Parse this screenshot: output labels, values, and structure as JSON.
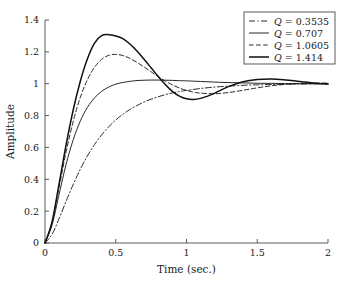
{
  "chart_data": {
    "type": "line",
    "title": "",
    "xlabel": "Time (sec.)",
    "ylabel": "Amplitude",
    "xlim": [
      0,
      2
    ],
    "ylim": [
      0,
      1.4
    ],
    "xticks": [
      "0",
      "0.5",
      "1",
      "1.5",
      "2"
    ],
    "xtick_values": [
      0,
      0.5,
      1,
      1.5,
      2
    ],
    "yticks": [
      "0",
      "0.2",
      "0.4",
      "0.6",
      "0.8",
      "1",
      "1.2",
      "1.4"
    ],
    "ytick_values": [
      0,
      0.2,
      0.4,
      0.6,
      0.8,
      1.0,
      1.2,
      1.4
    ],
    "grid": false,
    "legend_position": "upper right",
    "series": [
      {
        "name": "Q = 0.3535",
        "q": 0.3535,
        "linestyle": "dashdot",
        "linewidth": 0.9,
        "color": "#111111",
        "x": [
          0,
          0.05,
          0.1,
          0.15,
          0.2,
          0.25,
          0.3,
          0.35,
          0.4,
          0.45,
          0.5,
          0.55,
          0.6,
          0.65,
          0.7,
          0.75,
          0.8,
          0.85,
          0.9,
          0.95,
          1.0,
          1.1,
          1.2,
          1.3,
          1.4,
          1.5,
          1.6,
          1.7,
          1.8,
          1.9,
          2.0
        ],
        "y": [
          0,
          0.055,
          0.154,
          0.264,
          0.369,
          0.464,
          0.547,
          0.618,
          0.678,
          0.729,
          0.772,
          0.808,
          0.838,
          0.863,
          0.885,
          0.903,
          0.918,
          0.931,
          0.942,
          0.951,
          0.958,
          0.97,
          0.979,
          0.985,
          0.99,
          0.993,
          0.995,
          0.997,
          0.998,
          0.999,
          0.999
        ]
      },
      {
        "name": "Q = 0.707",
        "q": 0.707,
        "linestyle": "solid",
        "linewidth": 0.9,
        "color": "#111111",
        "x": [
          0,
          0.05,
          0.1,
          0.15,
          0.2,
          0.25,
          0.3,
          0.35,
          0.4,
          0.45,
          0.5,
          0.55,
          0.6,
          0.65,
          0.7,
          0.75,
          0.8,
          0.85,
          0.9,
          0.95,
          1.0,
          1.1,
          1.2,
          1.3,
          1.4,
          1.5,
          1.6,
          1.7,
          1.8,
          1.9,
          2.0
        ],
        "y": [
          0,
          0.113,
          0.308,
          0.497,
          0.65,
          0.767,
          0.852,
          0.911,
          0.952,
          0.979,
          0.997,
          1.008,
          1.015,
          1.02,
          1.022,
          1.023,
          1.023,
          1.022,
          1.021,
          1.019,
          1.018,
          1.014,
          1.01,
          1.007,
          1.005,
          1.003,
          1.002,
          1.001,
          1.0,
          1.0,
          1.0
        ]
      },
      {
        "name": "Q = 1.0605",
        "q": 1.0605,
        "linestyle": "dashed",
        "linewidth": 0.9,
        "color": "#111111",
        "x": [
          0,
          0.05,
          0.1,
          0.15,
          0.2,
          0.25,
          0.3,
          0.35,
          0.4,
          0.45,
          0.5,
          0.55,
          0.6,
          0.65,
          0.7,
          0.75,
          0.8,
          0.85,
          0.9,
          0.95,
          1.0,
          1.05,
          1.1,
          1.2,
          1.3,
          1.4,
          1.5,
          1.6,
          1.7,
          1.8,
          1.9,
          2.0
        ],
        "y": [
          0,
          0.128,
          0.352,
          0.575,
          0.766,
          0.915,
          1.026,
          1.103,
          1.153,
          1.178,
          1.184,
          1.177,
          1.159,
          1.134,
          1.105,
          1.075,
          1.045,
          1.017,
          0.993,
          0.973,
          0.958,
          0.947,
          0.941,
          0.937,
          0.945,
          0.959,
          0.974,
          0.987,
          0.996,
          1.002,
          1.004,
          1.004
        ]
      },
      {
        "name": "Q = 1.414",
        "q": 1.414,
        "linestyle": "solid",
        "linewidth": 1.5,
        "color": "#111111",
        "x": [
          0,
          0.05,
          0.1,
          0.15,
          0.2,
          0.25,
          0.3,
          0.35,
          0.4,
          0.45,
          0.5,
          0.55,
          0.6,
          0.65,
          0.7,
          0.75,
          0.8,
          0.85,
          0.9,
          0.95,
          1.0,
          1.05,
          1.1,
          1.15,
          1.2,
          1.3,
          1.4,
          1.5,
          1.6,
          1.7,
          1.8,
          1.9,
          2.0
        ],
        "y": [
          0,
          0.134,
          0.374,
          0.62,
          0.838,
          1.017,
          1.157,
          1.255,
          1.302,
          1.308,
          1.3,
          1.283,
          1.249,
          1.205,
          1.154,
          1.1,
          1.045,
          0.995,
          0.952,
          0.922,
          0.905,
          0.901,
          0.908,
          0.922,
          0.941,
          0.983,
          1.012,
          1.026,
          1.03,
          1.024,
          1.014,
          1.005,
          0.998
        ]
      }
    ],
    "legend_entries": [
      {
        "label": "Q = 0.3535",
        "symbol": "Q",
        "equals": "=",
        "value": "0.3535",
        "linestyle": "dashdot"
      },
      {
        "label": "Q = 0.707",
        "symbol": "Q",
        "equals": "=",
        "value": "0.707",
        "linestyle": "solid"
      },
      {
        "label": "Q = 1.0605",
        "symbol": "Q",
        "equals": "=",
        "value": "1.0605",
        "linestyle": "dashed"
      },
      {
        "label": "Q = 1.414",
        "symbol": "Q",
        "equals": "=",
        "value": "1.414",
        "linestyle": "solid-thick"
      }
    ]
  }
}
